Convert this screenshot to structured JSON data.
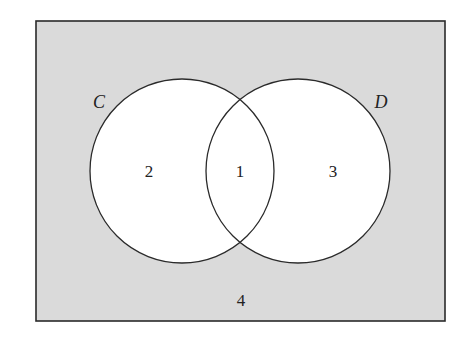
{
  "diagram": {
    "type": "venn",
    "universe": {
      "label": "",
      "fill_color": "#dadada"
    },
    "sets": [
      {
        "id": "C",
        "label": "C"
      },
      {
        "id": "D",
        "label": "D"
      }
    ],
    "regions": [
      {
        "id": "1",
        "label": "1",
        "description": "C ∩ D"
      },
      {
        "id": "2",
        "label": "2",
        "description": "C only"
      },
      {
        "id": "3",
        "label": "3",
        "description": "D only"
      },
      {
        "id": "4",
        "label": "4",
        "description": "outside C and D"
      }
    ],
    "colors": {
      "background_shade": "#dadada",
      "circle_interior": "#ffffff",
      "stroke": "#2a2a2a"
    }
  }
}
